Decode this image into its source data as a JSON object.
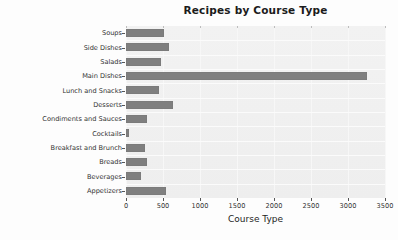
{
  "chart_data": {
    "type": "bar",
    "orientation": "horizontal",
    "title": "Recipes by Course Type",
    "xlabel": "Course Type",
    "ylabel": "Recipe Count",
    "xlim": [
      0,
      3500
    ],
    "ylim_categories": 12,
    "grid": true,
    "legend": null,
    "bar_color": "#7f7f7f",
    "plot_background": "#f0f0f0",
    "figure_background": "#fdfdfd",
    "xticks": [
      0,
      500,
      1000,
      1500,
      2000,
      2500,
      3000,
      3500
    ],
    "xtick_labels": [
      "0",
      "500",
      "1000",
      "1500",
      "2000",
      "2500",
      "3000",
      "3500"
    ],
    "categories": [
      "Soups",
      "Side Dishes",
      "Salads",
      "Main Dishes",
      "Lunch and Snacks",
      "Desserts",
      "Condiments and Sauces",
      "Cocktails",
      "Breakfast and Brunch",
      "Breads",
      "Beverages",
      "Appetizers"
    ],
    "values": [
      520,
      585,
      470,
      3250,
      440,
      640,
      280,
      40,
      250,
      290,
      200,
      535
    ],
    "series": [
      {
        "name": "Recipe Count",
        "values": [
          520,
          585,
          470,
          3250,
          440,
          640,
          280,
          40,
          250,
          290,
          200,
          535
        ]
      }
    ]
  }
}
